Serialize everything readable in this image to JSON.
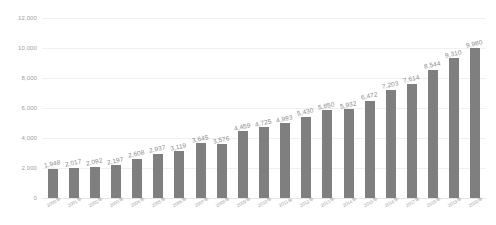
{
  "chart_data": {
    "type": "bar",
    "title": "",
    "subtitle": "",
    "xlabel": "",
    "ylabel": "",
    "ylim": [
      0,
      12000
    ],
    "yticks": [
      "0",
      "2,000",
      "4,000",
      "6,000",
      "8,000",
      "10,000",
      "12,000"
    ],
    "ytick_values": [
      0,
      2000,
      4000,
      6000,
      8000,
      10000,
      12000
    ],
    "grid": true,
    "legend": "none",
    "bar_color": "#7f7f7f",
    "gridline_color": "#f0f0f0",
    "label_color": "#8a8a8a",
    "categories": [
      "2000年",
      "2001年",
      "2002年",
      "2003年",
      "2004年",
      "2005年",
      "2006年",
      "2007年",
      "2008年",
      "2009年",
      "2010年",
      "2011年",
      "2012年",
      "2013年",
      "2014年",
      "2015年",
      "2016年",
      "2017年",
      "2018年",
      "2019年",
      "2020年"
    ],
    "values": [
      1948,
      2017,
      2092,
      2197,
      2608,
      2937,
      3119,
      3645,
      3576,
      4459,
      4725,
      4993,
      5430,
      5850,
      5932,
      6472,
      7203,
      7614,
      8544,
      9310,
      9980
    ],
    "value_labels": [
      "1,948",
      "2,017",
      "2,092",
      "2,197",
      "2,608",
      "2,937",
      "3,119",
      "3,645",
      "3,576",
      "4,459",
      "4,725",
      "4,993",
      "5,430",
      "5,850",
      "5,932",
      "6,472",
      "7,203",
      "7,614",
      "8,544",
      "9,310",
      "9,980"
    ]
  }
}
